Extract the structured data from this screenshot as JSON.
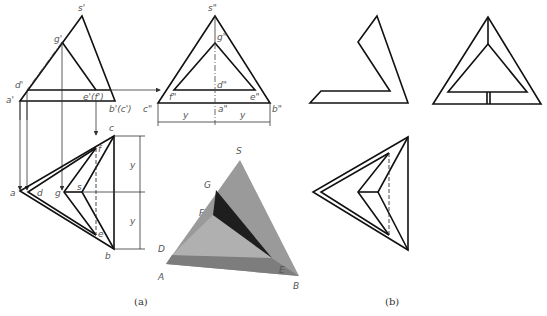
{
  "figure": {
    "captions": {
      "a": "(a)",
      "b": "(b)"
    },
    "front_view": {
      "labels": {
        "s": "s'",
        "g": "g'",
        "d": "d'",
        "a": "a'",
        "ef": "e'(f')",
        "bc": "b'(c')"
      }
    },
    "side_view": {
      "labels": {
        "s": "s\"",
        "g": "g\"",
        "d": "d\"",
        "f": "f\"",
        "e": "e\"",
        "c": "c\"",
        "a": "a\"",
        "b": "b\"",
        "y1": "y",
        "y2": "y"
      }
    },
    "top_view": {
      "labels": {
        "c": "c",
        "f": "f",
        "a": "a",
        "d": "d",
        "g": "g",
        "s": "s",
        "e": "e",
        "b": "b",
        "y1": "y",
        "y2": "y"
      }
    },
    "solid_view": {
      "labels": {
        "S": "S",
        "G": "G",
        "F": "F",
        "D": "D",
        "A": "A",
        "E": "E",
        "B": "B"
      },
      "colors": {
        "light": "#a8a8a8",
        "mid": "#8c8c8c",
        "dark": "#222222",
        "base": "#7a7a7a"
      }
    }
  }
}
